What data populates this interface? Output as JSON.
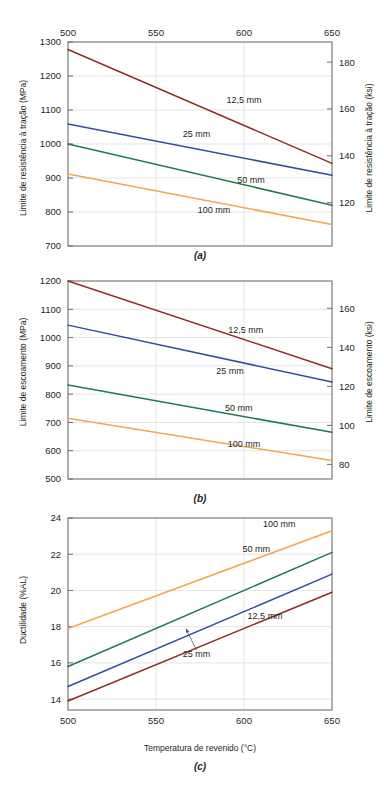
{
  "figure": {
    "caption_letters": [
      "(a)",
      "(b)",
      "(c)"
    ],
    "xlabel": "Temperatura de revenido (°C)",
    "x_ticks": [
      "500",
      "550",
      "600",
      "650"
    ],
    "x_values": [
      500,
      550,
      600,
      650
    ],
    "series_labels": [
      "12,5 mm",
      "25 mm",
      "50 mm",
      "100 mm"
    ],
    "colors": {
      "series_12_5mm": "#8c2f22",
      "series_25mm": "#2f4f9e",
      "series_50mm": "#1f7a4d",
      "series_100mm": "#f0a850",
      "axis": "#6d6e71",
      "grid": "#d8d8d8",
      "text": "#231f20"
    }
  },
  "chart_data": [
    {
      "type": "line",
      "panel": "(a)",
      "title": "",
      "xlabel": "",
      "ylabel": "Limite de resistência à tração (MPa)",
      "y2label": "Limite de resistência à tração (ksi)",
      "x": [
        500,
        650
      ],
      "xlim": [
        500,
        650
      ],
      "xticks": [
        500,
        550,
        600,
        650
      ],
      "xticklabels": [
        "500",
        "550",
        "600",
        "650"
      ],
      "x_axis_position": "top",
      "ylim": [
        700,
        1300
      ],
      "yticks": [
        700,
        800,
        900,
        1000,
        1100,
        1200,
        1300
      ],
      "yticklabels": [
        "700",
        "800",
        "900",
        "1000",
        "1100",
        "1200",
        "1300"
      ],
      "y2lim": [
        101.5,
        188.6
      ],
      "y2ticks": [
        120,
        140,
        160,
        180
      ],
      "y2ticklabels": [
        "120",
        "140",
        "160",
        "180"
      ],
      "grid": true,
      "legend": "inline-annotations",
      "series": [
        {
          "name": "12,5 mm",
          "color": "#8c2f22",
          "values": [
            1278,
            943
          ],
          "label_x": 600,
          "label_y": 1120
        },
        {
          "name": "25 mm",
          "color": "#2f4f9e",
          "values": [
            1059,
            908
          ],
          "label_x": 573,
          "label_y": 1022
        },
        {
          "name": "50 mm",
          "color": "#1f7a4d",
          "values": [
            1000,
            820
          ],
          "label_x": 604,
          "label_y": 884
        },
        {
          "name": "100 mm",
          "color": "#f0a850",
          "values": [
            912,
            763
          ],
          "label_x": 583,
          "label_y": 796
        }
      ]
    },
    {
      "type": "line",
      "panel": "(b)",
      "title": "",
      "xlabel": "",
      "ylabel": "Limite de escoamento (MPa)",
      "y2label": "Limite de escoamento (ksi)",
      "x": [
        500,
        650
      ],
      "xlim": [
        500,
        650
      ],
      "xticks": [
        500,
        550,
        600,
        650
      ],
      "xticklabels": [],
      "x_axis_position": "none",
      "ylim": [
        500,
        1200
      ],
      "yticks": [
        500,
        600,
        700,
        800,
        900,
        1000,
        1100,
        1200
      ],
      "yticklabels": [
        "500",
        "600",
        "700",
        "800",
        "900",
        "1000",
        "1100",
        "1200"
      ],
      "y2lim": [
        72.5,
        174.0
      ],
      "y2ticks": [
        80,
        100,
        120,
        140,
        160
      ],
      "y2ticklabels": [
        "80",
        "100",
        "120",
        "140",
        "160"
      ],
      "grid": true,
      "legend": "inline-annotations",
      "series": [
        {
          "name": "12,5 mm",
          "color": "#8c2f22",
          "values": [
            1200,
            890
          ],
          "label_x": 601,
          "label_y": 1015
        },
        {
          "name": "25 mm",
          "color": "#2f4f9e",
          "values": [
            1044,
            843
          ],
          "label_x": 592,
          "label_y": 872
        },
        {
          "name": "50 mm",
          "color": "#1f7a4d",
          "values": [
            832,
            665
          ],
          "label_x": 597,
          "label_y": 742
        },
        {
          "name": "100 mm",
          "color": "#f0a850",
          "values": [
            715,
            565
          ],
          "label_x": 600,
          "label_y": 612
        }
      ]
    },
    {
      "type": "line",
      "panel": "(c)",
      "title": "",
      "xlabel": "Temperatura de revenido (°C)",
      "ylabel": "Ductilidade (%AL)",
      "y2label": "",
      "x": [
        500,
        650
      ],
      "xlim": [
        500,
        650
      ],
      "xticks": [
        500,
        550,
        600,
        650
      ],
      "xticklabels": [
        "500",
        "550",
        "600",
        "650"
      ],
      "x_axis_position": "bottom",
      "ylim": [
        13.4,
        24
      ],
      "yticks": [
        14,
        16,
        18,
        20,
        22,
        24
      ],
      "yticklabels": [
        "14",
        "16",
        "18",
        "20",
        "22",
        "24"
      ],
      "grid": true,
      "legend": "inline-annotations",
      "series": [
        {
          "name": "100 mm",
          "color": "#f0a850",
          "values": [
            17.9,
            23.3
          ],
          "label_x": 620,
          "label_y": 23.5
        },
        {
          "name": "50 mm",
          "color": "#1f7a4d",
          "values": [
            15.8,
            22.1
          ],
          "label_x": 607,
          "label_y": 22.1
        },
        {
          "name": "25 mm",
          "color": "#2f4f9e",
          "values": [
            14.7,
            20.9
          ],
          "label_x": 573,
          "label_y": 16.3,
          "annotated": true,
          "arrow_from_x": 573,
          "arrow_from_y": 16.7,
          "arrow_to_x": 567,
          "arrow_to_y": 17.9
        },
        {
          "name": "12,5 mm",
          "color": "#8c2f22",
          "values": [
            13.9,
            19.9
          ],
          "label_x": 612,
          "label_y": 18.4
        }
      ]
    }
  ]
}
